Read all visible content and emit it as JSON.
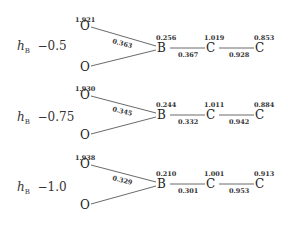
{
  "panels": [
    {
      "label_symbol": "h",
      "label_sub": "B",
      "label_value": "−0.5",
      "atoms": {
        "O_top": {
          "symbol": "O",
          "charge": "1.921"
        },
        "O_bottom": {
          "symbol": "O",
          "charge": ""
        },
        "B": {
          "symbol": "B",
          "charge": "0.256"
        },
        "C1": {
          "symbol": "C",
          "charge": "1.019"
        },
        "C2": {
          "symbol": "C",
          "charge": "0.853"
        }
      },
      "bonds": {
        "O_B": "0.363",
        "B_C1": "0.367",
        "C1_C2": "0.928"
      }
    },
    {
      "label_symbol": "h",
      "label_sub": "B",
      "label_value": "−0.75",
      "atoms": {
        "O_top": {
          "symbol": "O",
          "charge": "1.930"
        },
        "O_bottom": {
          "symbol": "O",
          "charge": ""
        },
        "B": {
          "symbol": "B",
          "charge": "0.244"
        },
        "C1": {
          "symbol": "C",
          "charge": "1.011"
        },
        "C2": {
          "symbol": "C",
          "charge": "0.884"
        }
      },
      "bonds": {
        "O_B": "0.345",
        "B_C1": "0.332",
        "C1_C2": "0.942"
      }
    },
    {
      "label_symbol": "h",
      "label_sub": "B",
      "label_value": "−1.0",
      "atoms": {
        "O_top": {
          "symbol": "O",
          "charge": "1.938"
        },
        "O_bottom": {
          "symbol": "O",
          "charge": ""
        },
        "B": {
          "symbol": "B",
          "charge": "0.210"
        },
        "C1": {
          "symbol": "C",
          "charge": "1.001"
        },
        "C2": {
          "symbol": "C",
          "charge": "0.913"
        }
      },
      "bonds": {
        "O_B": "0.329",
        "B_C1": "0.301",
        "C1_C2": "0.953"
      }
    }
  ]
}
